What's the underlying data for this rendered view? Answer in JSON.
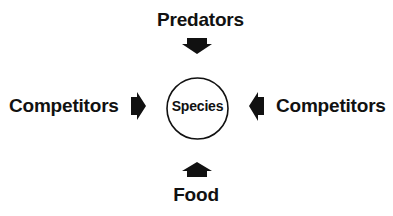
{
  "diagram": {
    "center": {
      "label": "Species",
      "shape": "circle"
    },
    "nodes": {
      "top": "Predators",
      "left": "Competitors",
      "right": "Competitors",
      "bottom": "Food"
    },
    "edges": [
      {
        "from": "Predators",
        "to": "Species",
        "direction": "down",
        "icon": "arrow-down-icon"
      },
      {
        "from": "Competitors",
        "to": "Species",
        "direction": "right",
        "icon": "arrow-right-icon"
      },
      {
        "from": "Competitors",
        "to": "Species",
        "direction": "left",
        "icon": "arrow-left-icon"
      },
      {
        "from": "Food",
        "to": "Species",
        "direction": "up",
        "icon": "arrow-up-icon"
      }
    ],
    "colors": {
      "ink": "#111111",
      "background": "#ffffff"
    }
  }
}
